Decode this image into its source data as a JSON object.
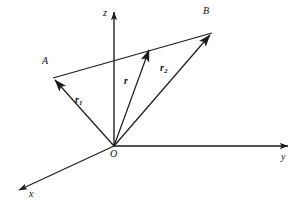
{
  "figure": {
    "background_color": "#ffffff",
    "stroke_color": "#1a1a1a",
    "width": 295,
    "height": 212
  },
  "axes": [
    {
      "key": "z",
      "label": "z",
      "description": "vertical axis pointing up from origin",
      "from": [
        114,
        146
      ],
      "to": [
        114,
        12
      ],
      "label_pos": [
        103,
        10
      ]
    },
    {
      "key": "y",
      "label": "y",
      "description": "horizontal axis pointing right from origin",
      "from": [
        114,
        146
      ],
      "to": [
        288,
        146
      ],
      "label_pos": [
        281,
        152
      ]
    },
    {
      "key": "x",
      "label": "x",
      "description": "oblique axis pointing down-left from origin",
      "from": [
        114,
        146
      ],
      "to": [
        19,
        190
      ],
      "label_pos": [
        29,
        190
      ]
    }
  ],
  "points": [
    {
      "key": "O",
      "label": "O",
      "description": "origin",
      "pos": [
        114,
        146
      ],
      "label_pos": [
        110,
        151
      ]
    },
    {
      "key": "A",
      "label": "A",
      "description": "point A, head of vector r1",
      "pos": [
        53,
        78
      ],
      "label_pos": [
        42,
        59
      ]
    },
    {
      "key": "B",
      "label": "B",
      "description": "point B, head of vector r2",
      "pos": [
        212,
        33
      ],
      "label_pos": [
        203,
        9
      ]
    }
  ],
  "vectors": [
    {
      "key": "r1",
      "label": "r",
      "subscript": "1",
      "description": "position vector from origin O to point A",
      "from": [
        114,
        146
      ],
      "to": [
        53,
        78
      ],
      "label_pos": [
        75,
        97
      ],
      "arrowhead": "large"
    },
    {
      "key": "r2",
      "label": "r",
      "subscript": "2",
      "description": "position vector from origin O to point B",
      "from": [
        114,
        146
      ],
      "to": [
        212,
        33
      ],
      "label_pos": [
        160,
        65
      ],
      "arrowhead": "large"
    },
    {
      "key": "r",
      "label": "r",
      "subscript": "",
      "description": "vector from origin O to a point on segment AB",
      "from": [
        114,
        146
      ],
      "to": [
        150,
        48
      ],
      "label_pos": [
        124,
        78
      ],
      "arrowhead": "large"
    },
    {
      "key": "AB",
      "label": "",
      "subscript": "",
      "description": "line segment joining point A to point B passing through head of r",
      "from": [
        53,
        78
      ],
      "to": [
        212,
        33
      ],
      "label_pos": [
        0,
        0
      ],
      "arrowhead": "none"
    }
  ]
}
